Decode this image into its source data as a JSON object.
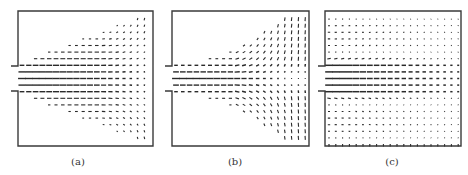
{
  "figure": {
    "panels": [
      {
        "id": "a",
        "label": "(a)",
        "frame": {
          "left": 18,
          "top": 11,
          "right": 153,
          "bottom": 146
        },
        "inlet": {
          "top": 66,
          "bottom": 91,
          "stub_x": 11
        },
        "field": "jet_free",
        "label_x": 78
      },
      {
        "id": "b",
        "label": "(b)",
        "frame": {
          "left": 172,
          "top": 11,
          "right": 309,
          "bottom": 146
        },
        "inlet": {
          "top": 66,
          "bottom": 91,
          "stub_x": 165
        },
        "field": "jet_impinging",
        "label_x": 235
      },
      {
        "id": "c",
        "label": "(c)",
        "frame": {
          "left": 325,
          "top": 11,
          "right": 461,
          "bottom": 146
        },
        "inlet": {
          "top": 66,
          "bottom": 91,
          "stub_x": 318
        },
        "field": "recirculating",
        "label_x": 392
      }
    ],
    "colors": {
      "ink": "#2a2a2a",
      "frame": "#3a3a3a",
      "background": "#ffffff"
    },
    "grid": {
      "dx": 6.8,
      "dy": 6.6
    }
  }
}
